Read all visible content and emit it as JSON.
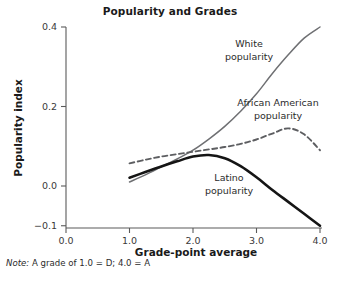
{
  "figure": {
    "title": "Popularity and Grades",
    "note_prefix": "Note:",
    "note_text": " A grade of 1.0 = D; 4.0 = A",
    "top_bleed_text": "",
    "bottom_bleed_text": ""
  },
  "chart_data": {
    "type": "line",
    "title": "Popularity and Grades",
    "xlabel": "Grade-point average",
    "ylabel": "Popularity index",
    "xlim": [
      0.0,
      4.0
    ],
    "ylim": [
      -0.1,
      0.4
    ],
    "xticks": [
      "0.0",
      "1.0",
      "2.0",
      "3.0",
      "4.0"
    ],
    "xtick_values": [
      0.0,
      1.0,
      2.0,
      3.0,
      4.0
    ],
    "yticks": [
      "0.4",
      "0.2",
      "0.0",
      "-0.1"
    ],
    "ytick_values": [
      0.4,
      0.2,
      0.0,
      -0.1
    ],
    "grid": false,
    "legend_position": "inline-annotations",
    "note": "A grade of 1.0 = D; 4.0 = A",
    "x": [
      1.0,
      1.25,
      1.5,
      1.75,
      2.0,
      2.25,
      2.5,
      2.75,
      3.0,
      3.25,
      3.5,
      3.75,
      4.0
    ],
    "series": [
      {
        "name": "White popularity",
        "label": "White",
        "label_line2": "popularity",
        "style": "solid-gray",
        "color": "#6f7073",
        "values": [
          0.01,
          0.028,
          0.048,
          0.068,
          0.09,
          0.118,
          0.15,
          0.188,
          0.232,
          0.283,
          0.33,
          0.372,
          0.4
        ]
      },
      {
        "name": "African American popularity",
        "label": "African American",
        "label_line2": "popularity",
        "style": "dashed",
        "color": "#5d5e61",
        "values": [
          0.057,
          0.066,
          0.074,
          0.08,
          0.086,
          0.092,
          0.098,
          0.106,
          0.117,
          0.132,
          0.145,
          0.13,
          0.09
        ]
      },
      {
        "name": "Latino popularity",
        "label": "Latino",
        "label_line2": "popularity",
        "style": "solid-black-thick",
        "color": "#151515",
        "values": [
          0.021,
          0.035,
          0.049,
          0.062,
          0.074,
          0.078,
          0.07,
          0.05,
          0.022,
          -0.01,
          -0.04,
          -0.07,
          -0.1
        ]
      }
    ],
    "annotations": [
      {
        "text": "White popularity",
        "x": 2.9,
        "y": 0.325
      },
      {
        "text": "African American popularity",
        "x": 3.2,
        "y": 0.195
      },
      {
        "text": "Latino popularity",
        "x": 2.55,
        "y": 0.035
      }
    ]
  }
}
